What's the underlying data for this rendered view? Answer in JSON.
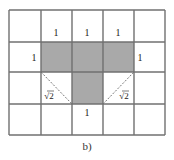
{
  "figure": {
    "caption": "b)",
    "grid": {
      "columns": 5,
      "rows": 4,
      "x_edges": [
        9,
        41,
        72,
        103,
        134,
        165
      ],
      "y_edges": [
        10,
        42,
        72,
        104,
        135
      ],
      "line_color": "#707070",
      "fill_color": "#a9a9a9"
    },
    "shaded_cells": [
      {
        "row": 1,
        "col": 1
      },
      {
        "row": 1,
        "col": 2
      },
      {
        "row": 1,
        "col": 3
      },
      {
        "row": 2,
        "col": 2
      }
    ],
    "labels": [
      {
        "text": "1",
        "x": 56,
        "y": 36
      },
      {
        "text": "1",
        "x": 87,
        "y": 36
      },
      {
        "text": "1",
        "x": 118,
        "y": 36
      },
      {
        "text": "1",
        "x": 34,
        "y": 61
      },
      {
        "text": "1",
        "x": 140,
        "y": 61
      },
      {
        "text": "1",
        "x": 87,
        "y": 116
      }
    ],
    "diagonals": [
      {
        "x1": 41,
        "y1": 72,
        "x2": 72,
        "y2": 104,
        "label": "√2",
        "lx": 49,
        "ly": 99
      },
      {
        "x1": 103,
        "y1": 104,
        "x2": 134,
        "y2": 72,
        "label": "√2",
        "lx": 124,
        "ly": 99
      }
    ]
  }
}
